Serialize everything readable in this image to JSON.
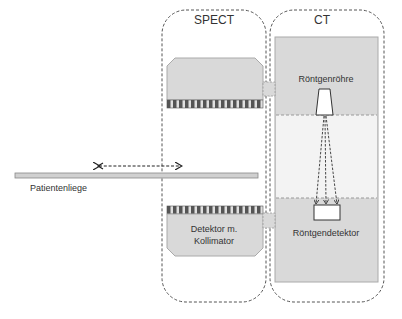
{
  "diagram": {
    "spect": {
      "title": "SPECT"
    },
    "ct": {
      "title": "CT"
    },
    "labels": {
      "xray_tube": "Röntgenröhre",
      "xray_detector": "Röntgendetektor",
      "detector_collimator_line1": "Detektor m.",
      "detector_collimator_line2": "Kollimator",
      "patient_table": "Patientenliege"
    },
    "colors": {
      "dashed_outline": "#555555",
      "gantry_fill": "#d9d9d9",
      "bore_fill": "#f3f3f3",
      "collimator_dark": "#555555",
      "collimator_light": "#e0e0e0",
      "table_fill": "#d0d0d0"
    }
  }
}
